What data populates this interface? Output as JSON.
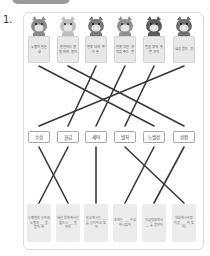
{
  "question_number": "1.",
  "top_cards": [
    {
      "animal": "cat",
      "text": "노벨이 만든 상"
    },
    {
      "animal": "dog",
      "text": "친절하는 행동 따위 용이"
    },
    {
      "animal": "giraffe",
      "text": "벌로 내게 주는 돈"
    },
    {
      "animal": "pig",
      "text": "잘못 착한 규칙을 주는 벌"
    },
    {
      "animal": "monkey",
      "text": "일을 정해 놓은 규칙"
    },
    {
      "animal": "raccoon",
      "text": "상을 받는 것"
    }
  ],
  "words": [
    "수상",
    "월급",
    "세탁",
    "벌칙",
    "노벨상",
    "상장"
  ],
  "clues": [
    "스웨덴의 알프레 노벨의 ___ 을 받아 해",
    "내년 방학에서는 월드시 ___ 할 자라",
    "학교에서는 ___ 를 공지하고 있어",
    "조에는 ___ 수성하시 있어",
    "지금 대회에서 ___ 를 받았어",
    "대회에서 사랑 어렵 ___ 하 있어?"
  ],
  "connections_top": [
    [
      0,
      4
    ],
    [
      1,
      5
    ],
    [
      2,
      1
    ],
    [
      3,
      2
    ],
    [
      4,
      3
    ],
    [
      5,
      0
    ]
  ],
  "connections_bottom": [
    [
      0,
      1
    ],
    [
      1,
      0
    ],
    [
      2,
      2
    ],
    [
      3,
      5
    ],
    [
      4,
      3
    ],
    [
      5,
      4
    ]
  ],
  "colors": {
    "line": "#3a3a3a",
    "card": "#e8e8e8",
    "frame": "#dcdcdc",
    "tab": "#9a9a9a"
  }
}
